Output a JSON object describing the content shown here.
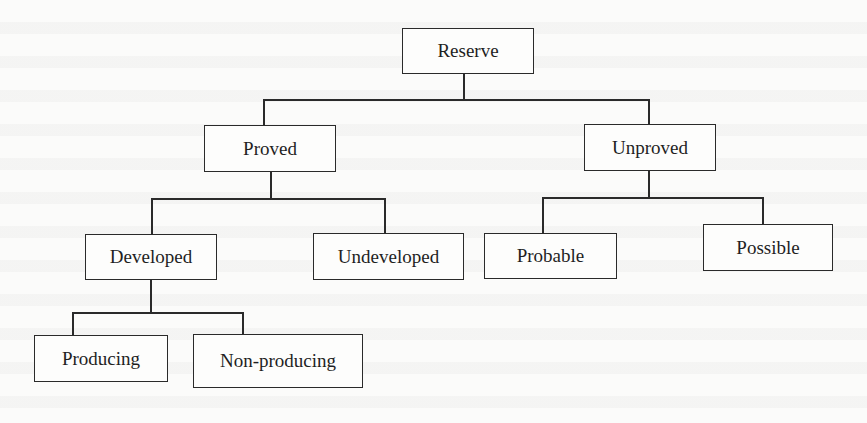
{
  "diagram": {
    "type": "tree",
    "title": "",
    "colors": {
      "line": "#2a2a2a",
      "box_border": "#2a2a2a",
      "background": "#fbfbfa",
      "text": "#1f1f1f"
    },
    "nodes": {
      "reserve": {
        "label": "Reserve",
        "parent": null
      },
      "proved": {
        "label": "Proved",
        "parent": "reserve"
      },
      "unproved": {
        "label": "Unproved",
        "parent": "reserve"
      },
      "developed": {
        "label": "Developed",
        "parent": "proved"
      },
      "undeveloped": {
        "label": "Undeveloped",
        "parent": "proved"
      },
      "probable": {
        "label": "Probable",
        "parent": "unproved"
      },
      "possible": {
        "label": "Possible",
        "parent": "unproved"
      },
      "producing": {
        "label": "Producing",
        "parent": "developed"
      },
      "non_producing": {
        "label": "Non-producing",
        "parent": "developed"
      }
    },
    "edges": [
      [
        "reserve",
        "proved"
      ],
      [
        "reserve",
        "unproved"
      ],
      [
        "proved",
        "developed"
      ],
      [
        "proved",
        "undeveloped"
      ],
      [
        "unproved",
        "probable"
      ],
      [
        "unproved",
        "possible"
      ],
      [
        "developed",
        "producing"
      ],
      [
        "developed",
        "non_producing"
      ]
    ]
  }
}
